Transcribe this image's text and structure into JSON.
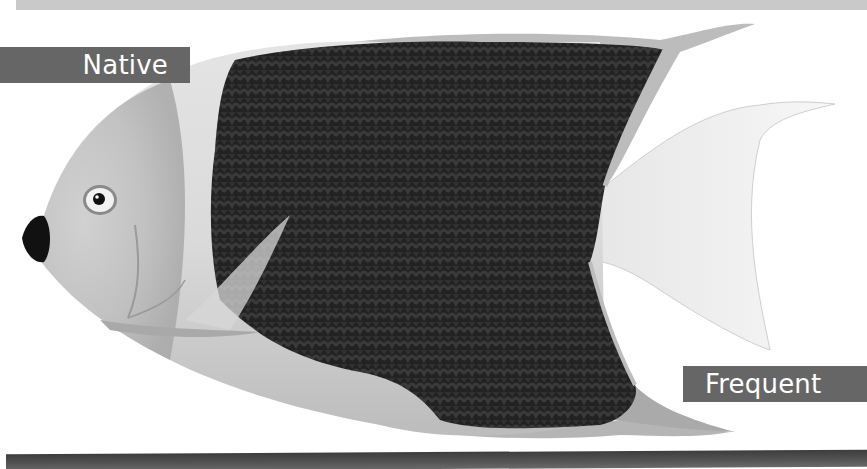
{
  "labels": {
    "native": "Native",
    "frequent": "Frequent"
  },
  "illustration": {
    "subject": "angelfish",
    "palette": {
      "body_light": "#dcdcdc",
      "body_dark": "#1e1e1e",
      "label_bg": "#666666",
      "label_text": "#ffffff",
      "top_bar": "#c9c9c9",
      "bottom_bar": "#444444"
    }
  }
}
